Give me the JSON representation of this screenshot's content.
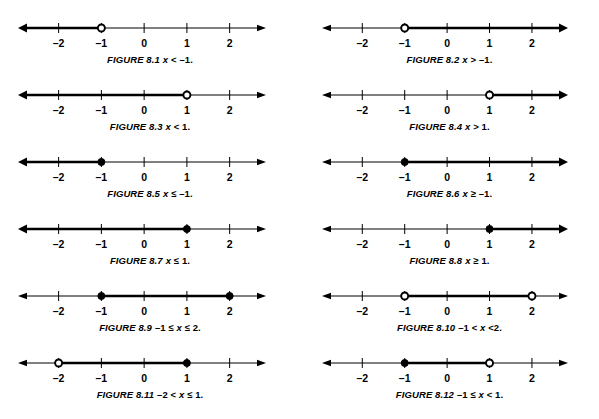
{
  "page": {
    "background_color": "#ffffff",
    "line_color": "#000000"
  },
  "axis": {
    "tick_labels": [
      "-2",
      "-1",
      "0",
      "1",
      "2"
    ],
    "tick_values": [
      -2,
      -1,
      0,
      1,
      2
    ],
    "min": -2.95,
    "max": 2.85
  },
  "figures": [
    {
      "id": "8.1",
      "label": "FIGURE 8.1",
      "expression": "x < -1.",
      "expr_prefix": "",
      "expr_var": "x",
      "expr_suffix": " < -1.",
      "shaded_from": -2.95,
      "shaded_to": -1,
      "endpoints": [
        {
          "value": -1,
          "type": "open"
        }
      ],
      "ray_left": true,
      "ray_right": false
    },
    {
      "id": "8.2",
      "label": "FIGURE 8.2",
      "expression": "x > -1.",
      "expr_prefix": "",
      "expr_var": "x",
      "expr_suffix": " > -1.",
      "shaded_from": -1,
      "shaded_to": 2.85,
      "endpoints": [
        {
          "value": -1,
          "type": "open"
        }
      ],
      "ray_left": false,
      "ray_right": true
    },
    {
      "id": "8.3",
      "label": "FIGURE 8.3",
      "expression": "x < 1.",
      "expr_prefix": "",
      "expr_var": "x",
      "expr_suffix": " < 1.",
      "shaded_from": -2.95,
      "shaded_to": 1,
      "endpoints": [
        {
          "value": 1,
          "type": "open"
        }
      ],
      "ray_left": true,
      "ray_right": false
    },
    {
      "id": "8.4",
      "label": "FIGURE 8.4",
      "expression": "x > 1.",
      "expr_prefix": "",
      "expr_var": "x",
      "expr_suffix": " > 1.",
      "shaded_from": 1,
      "shaded_to": 2.85,
      "endpoints": [
        {
          "value": 1,
          "type": "open"
        }
      ],
      "ray_left": false,
      "ray_right": true
    },
    {
      "id": "8.5",
      "label": "FIGURE 8.5",
      "expression": "x ≤ -1.",
      "expr_prefix": "",
      "expr_var": "x",
      "expr_suffix": " ≤ -1.",
      "shaded_from": -2.95,
      "shaded_to": -1,
      "endpoints": [
        {
          "value": -1,
          "type": "closed"
        }
      ],
      "ray_left": true,
      "ray_right": false
    },
    {
      "id": "8.6",
      "label": "FIGURE 8.6",
      "expression": "x ≥ -1.",
      "expr_prefix": "",
      "expr_var": "x",
      "expr_suffix": " ≥ -1.",
      "shaded_from": -1,
      "shaded_to": 2.85,
      "endpoints": [
        {
          "value": -1,
          "type": "closed"
        }
      ],
      "ray_left": false,
      "ray_right": true
    },
    {
      "id": "8.7",
      "label": "FIGURE 8.7",
      "expression": "x ≤ 1.",
      "expr_prefix": "",
      "expr_var": "x",
      "expr_suffix": " ≤ 1.",
      "shaded_from": -2.95,
      "shaded_to": 1,
      "endpoints": [
        {
          "value": 1,
          "type": "closed"
        }
      ],
      "ray_left": true,
      "ray_right": false
    },
    {
      "id": "8.8",
      "label": "FIGURE 8.8",
      "expression": "x ≥ 1.",
      "expr_prefix": "",
      "expr_var": "x",
      "expr_suffix": " ≥ 1.",
      "shaded_from": 1,
      "shaded_to": 2.85,
      "endpoints": [
        {
          "value": 1,
          "type": "closed"
        }
      ],
      "ray_left": false,
      "ray_right": true
    },
    {
      "id": "8.9",
      "label": "FIGURE 8.9",
      "expression": "-1 ≤ x ≤ 2.",
      "expr_prefix": "-1 ≤ ",
      "expr_var": "x",
      "expr_suffix": " ≤ 2.",
      "shaded_from": -1,
      "shaded_to": 2,
      "endpoints": [
        {
          "value": -1,
          "type": "closed"
        },
        {
          "value": 2,
          "type": "closed"
        }
      ],
      "ray_left": false,
      "ray_right": false
    },
    {
      "id": "8.10",
      "label": "FIGURE 8.10",
      "expression": "-1 < x <2.",
      "expr_prefix": "-1 < ",
      "expr_var": "x",
      "expr_suffix": " <2.",
      "shaded_from": -1,
      "shaded_to": 2,
      "endpoints": [
        {
          "value": -1,
          "type": "open"
        },
        {
          "value": 2,
          "type": "open"
        }
      ],
      "ray_left": false,
      "ray_right": false
    },
    {
      "id": "8.11",
      "label": "FIGURE 8.11",
      "expression": "-2 < x ≤ 1.",
      "expr_prefix": "-2 < ",
      "expr_var": "x",
      "expr_suffix": " ≤ 1.",
      "shaded_from": -2,
      "shaded_to": 1,
      "endpoints": [
        {
          "value": -2,
          "type": "open"
        },
        {
          "value": 1,
          "type": "closed"
        }
      ],
      "ray_left": false,
      "ray_right": false
    },
    {
      "id": "8.12",
      "label": "FIGURE 8.12",
      "expression": "-1 ≤ x < 1.",
      "expr_prefix": "-1 ≤ ",
      "expr_var": "x",
      "expr_suffix": " < 1.",
      "shaded_from": -1,
      "shaded_to": 1,
      "endpoints": [
        {
          "value": -1,
          "type": "closed"
        },
        {
          "value": 1,
          "type": "open"
        }
      ],
      "ray_left": false,
      "ray_right": false
    }
  ]
}
